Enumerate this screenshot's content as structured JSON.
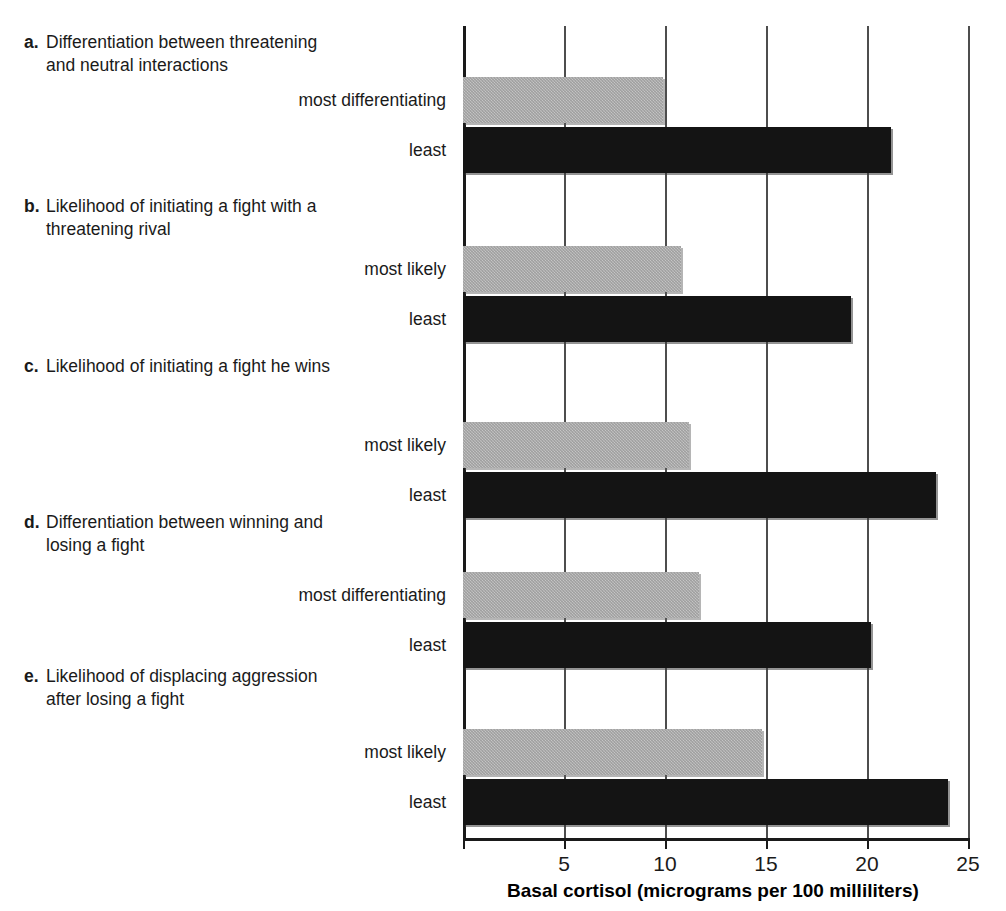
{
  "chart_data": {
    "type": "bar",
    "orientation": "horizontal",
    "title": "",
    "xlabel": "Basal cortisol (micrograms per 100 milliliters)",
    "ylabel": "",
    "xlim": [
      0,
      25
    ],
    "xticks": [
      0,
      5,
      10,
      15,
      20,
      25
    ],
    "xtick_labels": [
      "",
      "5",
      "10",
      "15",
      "20",
      "25"
    ],
    "grid": true,
    "grid_axis": "x",
    "legend": "none",
    "series": [
      {
        "name": "most",
        "color": "#c6c6c6",
        "values": [
          9.9,
          10.8,
          11.2,
          11.7,
          14.8
        ]
      },
      {
        "name": "least",
        "color": "#141414",
        "values": [
          21.2,
          19.2,
          23.4,
          20.2,
          24.0
        ]
      }
    ],
    "groups": [
      {
        "letter": "a.",
        "title_line1": "Differentiation between threatening",
        "title_line2": "and neutral interactions",
        "bars": [
          {
            "label": "most differentiating",
            "value": 9.9,
            "style": "gray"
          },
          {
            "label": "least",
            "value": 21.2,
            "style": "black"
          }
        ]
      },
      {
        "letter": "b.",
        "title_line1": "Likelihood of initiating a fight with a",
        "title_line2": "threatening rival",
        "bars": [
          {
            "label": "most likely",
            "value": 10.8,
            "style": "gray"
          },
          {
            "label": "least",
            "value": 19.2,
            "style": "black"
          }
        ]
      },
      {
        "letter": "c.",
        "title_line1": "Likelihood of initiating a fight he wins",
        "title_line2": "",
        "bars": [
          {
            "label": "most likely",
            "value": 11.2,
            "style": "gray"
          },
          {
            "label": "least",
            "value": 23.4,
            "style": "black"
          }
        ]
      },
      {
        "letter": "d.",
        "title_line1": "Differentiation between winning and",
        "title_line2": "losing a fight",
        "bars": [
          {
            "label": "most differentiating",
            "value": 11.7,
            "style": "gray"
          },
          {
            "label": "least",
            "value": 20.2,
            "style": "black"
          }
        ]
      },
      {
        "letter": "e.",
        "title_line1": "Likelihood of displacing aggression",
        "title_line2": "after losing a fight",
        "bars": [
          {
            "label": "most likely",
            "value": 14.8,
            "style": "gray"
          },
          {
            "label": "least",
            "value": 24.0,
            "style": "black"
          }
        ]
      }
    ]
  },
  "axis": {
    "title": "Basal cortisol (micrograms per 100 milliliters)",
    "tick_labels": [
      "",
      "5",
      "10",
      "15",
      "20",
      "25"
    ]
  },
  "colors": {
    "gray_bar": "#c6c6c6",
    "black_bar": "#141414",
    "gridline": "#4d4d4d",
    "axis": "#1a1a1a",
    "background": "#ffffff"
  }
}
